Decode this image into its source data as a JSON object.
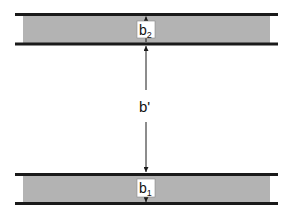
{
  "diagram": {
    "type": "layer-spacing",
    "colors": {
      "line": "#1a1a1a",
      "fill": "#b3b3b3",
      "label_bg": "#ffffff"
    },
    "layers": [
      {
        "name": "top-layer",
        "label_base": "b",
        "label_sub": "2"
      },
      {
        "name": "bottom-layer",
        "label_base": "b",
        "label_sub": "1"
      }
    ],
    "gap_label": "b'"
  }
}
